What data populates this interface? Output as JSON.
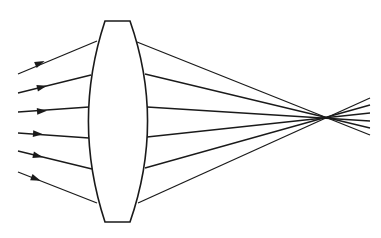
{
  "diagram": {
    "stroke_color": "#1a1a1a",
    "background": "#ffffff",
    "lens": {
      "type": "biconvex",
      "top_flat": {
        "x1": 105,
        "x2": 130,
        "y": 21
      },
      "bottom_flat": {
        "x1": 105,
        "x2": 130,
        "y": 222
      },
      "left_bulge_x": 88,
      "right_bulge_x": 148,
      "mid_y": 121
    },
    "focal_point": {
      "x": 328,
      "y": 117
    },
    "rays": [
      {
        "id": 1,
        "start": [
          18,
          74
        ],
        "lens_in": [
          97,
          41
        ],
        "lens_out": [
          137,
          42
        ],
        "end": [
          370,
          135
        ],
        "arrow_at": [
          40,
          63
        ]
      },
      {
        "id": 2,
        "start": [
          18,
          93
        ],
        "lens_in": [
          91,
          75
        ],
        "lens_out": [
          145,
          74
        ],
        "end": [
          370,
          128
        ],
        "arrow_at": [
          42,
          87
        ]
      },
      {
        "id": 3,
        "start": [
          18,
          112
        ],
        "lens_in": [
          89,
          107
        ],
        "lens_out": [
          147,
          107
        ],
        "end": [
          370,
          121
        ],
        "arrow_at": [
          42,
          111
        ]
      },
      {
        "id": 4,
        "start": [
          18,
          133
        ],
        "lens_in": [
          89,
          138
        ],
        "lens_out": [
          147,
          137
        ],
        "end": [
          370,
          113
        ],
        "arrow_at": [
          38,
          134
        ]
      },
      {
        "id": 5,
        "start": [
          18,
          151
        ],
        "lens_in": [
          92,
          169
        ],
        "lens_out": [
          145,
          168
        ],
        "end": [
          370,
          105
        ],
        "arrow_at": [
          38,
          156
        ]
      },
      {
        "id": 6,
        "start": [
          18,
          172
        ],
        "lens_in": [
          97,
          203
        ],
        "lens_out": [
          138,
          203
        ],
        "end": [
          370,
          98
        ],
        "arrow_at": [
          36,
          179
        ]
      }
    ]
  }
}
